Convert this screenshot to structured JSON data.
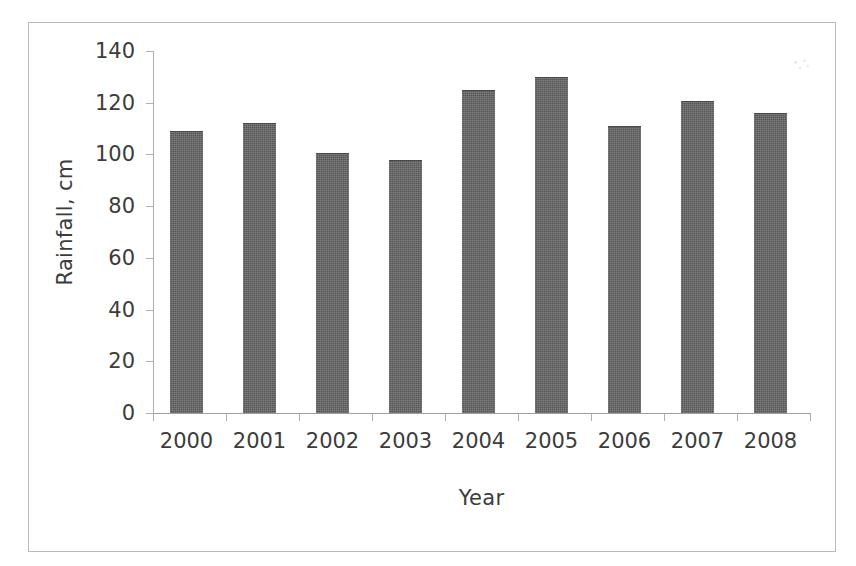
{
  "figure": {
    "background_color": "#ffffff",
    "frame_color": "#b9b9b9",
    "bar_color": "#575757",
    "axis_color": "#b0b0b0",
    "text_color": "#3c3c3c"
  },
  "chart_data": {
    "type": "bar",
    "title": "",
    "xlabel": "Year",
    "ylabel": "Rainfall, cm",
    "categories": [
      "2000",
      "2001",
      "2002",
      "2003",
      "2004",
      "2005",
      "2006",
      "2007",
      "2008"
    ],
    "values": [
      109,
      112,
      100.5,
      98,
      125,
      130,
      111,
      120.5,
      116
    ],
    "ylim": [
      0,
      140
    ],
    "yticks": [
      0,
      20,
      40,
      60,
      80,
      100,
      120,
      140
    ],
    "ytick_labels": [
      "0",
      "20",
      "40",
      "60",
      "80",
      "100",
      "120",
      "140"
    ],
    "grid": false,
    "legend": null,
    "series": [
      {
        "name": "Rainfall",
        "values": [
          109,
          112,
          100.5,
          98,
          125,
          130,
          111,
          120.5,
          116
        ]
      }
    ]
  }
}
